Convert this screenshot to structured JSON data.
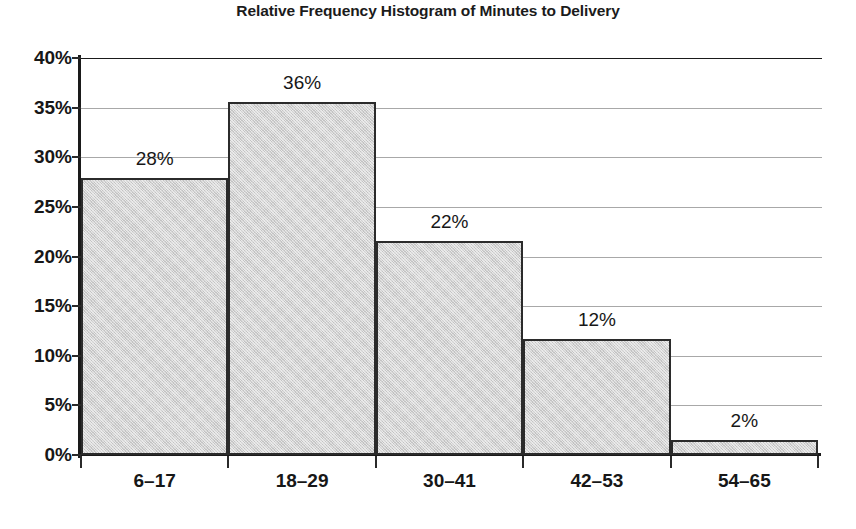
{
  "chart_data": {
    "type": "bar",
    "title": "Relative Frequency Histogram of Minutes to Delivery",
    "xlabel": "",
    "ylabel": "",
    "categories": [
      "6–17",
      "18–29",
      "30–41",
      "42–53",
      "54–65"
    ],
    "values": [
      27.9,
      35.6,
      21.6,
      11.7,
      1.5
    ],
    "data_labels": [
      "28%",
      "36%",
      "22%",
      "12%",
      "2%"
    ],
    "ylim": [
      0,
      40
    ],
    "ytick_values": [
      0,
      5,
      10,
      15,
      20,
      25,
      30,
      35,
      40
    ],
    "ytick_labels": [
      "0%",
      "5%",
      "10%",
      "15%",
      "20%",
      "25%",
      "30%",
      "35%",
      "40%"
    ],
    "grid": true,
    "grid_axis": "y",
    "legend": "none",
    "bar_fill_color": "#d2d2d2",
    "bar_edge_color": "#2b2b2b",
    "gridline_color": "#a8a8a8",
    "axis_color": "#1a1a1a",
    "text_color": "#171717"
  }
}
